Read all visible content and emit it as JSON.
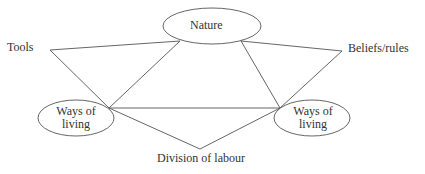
{
  "diagram": {
    "nodes": {
      "nature": "Nature",
      "tools": "Tools",
      "beliefs": "Beliefs/rules",
      "ways_left_1": "Ways of",
      "ways_left_2": "living",
      "ways_right_1": "Ways of",
      "ways_right_2": "living",
      "division": "Division of labour"
    },
    "colors": {
      "stroke": "#555555",
      "text": "#333333",
      "background": "#ffffff"
    }
  }
}
